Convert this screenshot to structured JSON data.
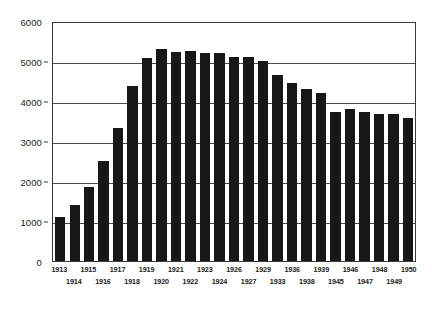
{
  "chart_data": {
    "type": "bar",
    "title": "",
    "subtitle": "",
    "xlabel": "",
    "ylabel": "",
    "categories": [
      "1913",
      "1914",
      "1915",
      "1916",
      "1917",
      "1918",
      "1919",
      "1920",
      "1921",
      "1922",
      "1923",
      "1924",
      "1926",
      "1927",
      "1929",
      "1933",
      "1936",
      "1938",
      "1939",
      "1945",
      "1946",
      "1947",
      "1948",
      "1949",
      "1950"
    ],
    "values": [
      1100,
      1400,
      1850,
      2500,
      3320,
      4380,
      5070,
      5290,
      5230,
      5260,
      5200,
      5210,
      5100,
      5100,
      5000,
      4660,
      4440,
      4310,
      4210,
      3730,
      3790,
      3720,
      3670,
      3670,
      3570
    ],
    "series": [
      {
        "name": "",
        "values": [
          1100,
          1400,
          1850,
          2500,
          3320,
          4380,
          5070,
          5290,
          5230,
          5260,
          5200,
          5210,
          5100,
          5100,
          5000,
          4660,
          4440,
          4310,
          4210,
          3730,
          3790,
          3720,
          3670,
          3670,
          3570
        ]
      }
    ],
    "ylim": [
      0,
      6000
    ],
    "yticks": [
      0,
      1000,
      2000,
      3000,
      4000,
      5000,
      6000
    ],
    "ytick_labels": [
      "0",
      "1000",
      "2000",
      "3000",
      "4000",
      "5000",
      "6000"
    ],
    "grid": true,
    "grid_axis": "y",
    "legend": false,
    "legend_position": "none",
    "bar_color": "#171717",
    "axis_color": "#3a3a3a",
    "grid_color": "#4a4a4a",
    "background_color": "#ffffff",
    "xtick_label_stagger": true,
    "annotations": []
  }
}
